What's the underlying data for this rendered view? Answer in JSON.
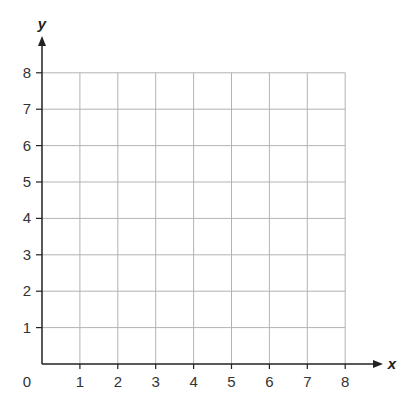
{
  "chart_data": {
    "type": "scatter",
    "title": "",
    "xlabel": "x",
    "ylabel": "y",
    "xlim": [
      0,
      8
    ],
    "ylim": [
      0,
      8
    ],
    "grid": true,
    "x_ticks": [
      "1",
      "2",
      "3",
      "4",
      "5",
      "6",
      "7",
      "8"
    ],
    "y_ticks": [
      "1",
      "2",
      "3",
      "4",
      "5",
      "6",
      "7",
      "8"
    ],
    "origin_label": "0",
    "series": [],
    "colors": {
      "axis": "#222222",
      "grid": "#b3b3b3",
      "text": "#333333"
    }
  }
}
